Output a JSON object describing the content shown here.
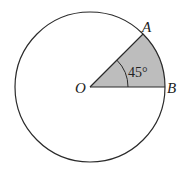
{
  "diagram": {
    "type": "circle-sector",
    "center_label": "O",
    "point_a_label": "A",
    "point_b_label": "B",
    "angle_label": "45°",
    "angle_degrees": 45,
    "colors": {
      "stroke": "#2a2a2a",
      "sector_fill": "#bdbdbd",
      "background": "#ffffff"
    }
  }
}
